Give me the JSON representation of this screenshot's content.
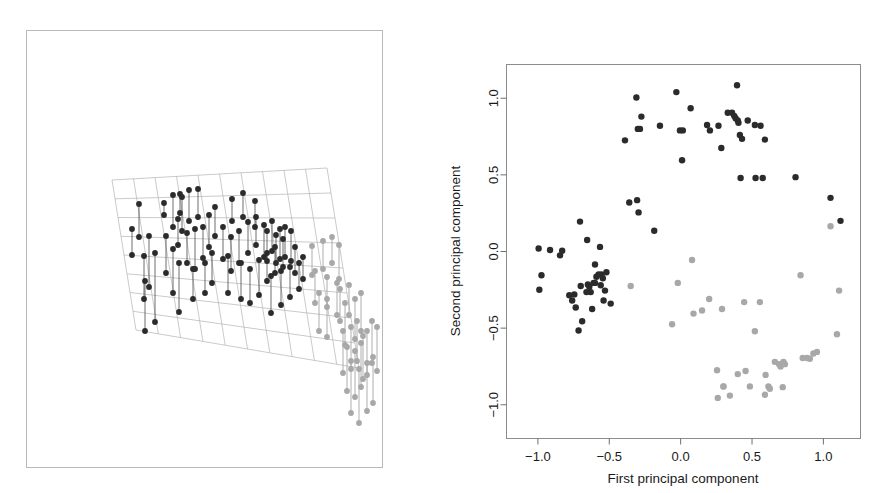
{
  "figure": {
    "panels": [
      "three-d-regression-plane",
      "pca-scatter"
    ],
    "background_color": "#ffffff"
  },
  "left_panel": {
    "name": "3D scatter with fitted plane",
    "border_color": "#b9b9b9",
    "mesh_color": "#b3b3b3",
    "dark_point_color": "#2b2b2b",
    "light_point_color": "#a8a8a8",
    "dark_line_color": "#4a4a4a",
    "light_line_color": "#9b9b9b"
  },
  "chart_data": [
    {
      "type": "scatter",
      "name": "three-d-plane-projection",
      "title": "",
      "xlabel": "",
      "ylabel": "",
      "grid": true,
      "legend": "none",
      "note": "Perspective 3-D scatterplot: points joined by vertical drop-lines to a fitted tilted regression plane drawn as a wire mesh.",
      "plane_mesh": {
        "corners": [
          [
            85,
            149
          ],
          [
            300,
            137
          ],
          [
            332,
            337
          ],
          [
            109,
            299
          ]
        ],
        "rows": 8,
        "cols": 10
      },
      "series": [
        {
          "name": "group-dark",
          "color": "#2b2b2b",
          "points": [
            [
              112,
              173,
              206
            ],
            [
              137,
              172,
              184
            ],
            [
              146,
              164,
              196
            ],
            [
              153,
              163,
              182
            ],
            [
              155,
              166,
              200
            ],
            [
              162,
              159,
              190
            ],
            [
              151,
              188,
              214
            ],
            [
              171,
              158,
              186
            ],
            [
              105,
              198,
              224
            ],
            [
              122,
              205,
              256
            ],
            [
              139,
              205,
              242
            ],
            [
              117,
              225,
              268
            ],
            [
              128,
              222,
              291
            ],
            [
              146,
              218,
              262
            ],
            [
              160,
              202,
              232
            ],
            [
              168,
              198,
              238
            ],
            [
              176,
              196,
              227
            ],
            [
              152,
              232,
              281
            ],
            [
              118,
              250,
              300
            ],
            [
              182,
              184,
              216
            ],
            [
              188,
              176,
              205
            ],
            [
              205,
              168,
              190
            ],
            [
              216,
              162,
              186
            ],
            [
              228,
              170,
              196
            ],
            [
              196,
              196,
              228
            ],
            [
              204,
              206,
              240
            ],
            [
              212,
              200,
              232
            ],
            [
              221,
              191,
              222
            ],
            [
              229,
              186,
              214
            ],
            [
              237,
              194,
              226
            ],
            [
              245,
              190,
              220
            ],
            [
              253,
              198,
              228
            ],
            [
              201,
              225,
              262
            ],
            [
              214,
              232,
              268
            ],
            [
              223,
              238,
              272
            ],
            [
              232,
              229,
              264
            ],
            [
              240,
              222,
              250
            ],
            [
              248,
              216,
              242
            ],
            [
              185,
              222,
              252
            ],
            [
              178,
              232,
              262
            ],
            [
              166,
              238,
              268
            ],
            [
              240,
              200,
              230
            ],
            [
              249,
              204,
              232
            ],
            [
              256,
              208,
              236
            ],
            [
              258,
              196,
              226
            ],
            [
              264,
              200,
              230
            ],
            [
              244,
              245,
              282
            ],
            [
              254,
              240,
              274
            ],
            [
              263,
              236,
              266
            ],
            [
              272,
              232,
              258
            ],
            [
              276,
              226,
              248
            ],
            [
              268,
              216,
              242
            ]
          ]
        },
        {
          "name": "group-light",
          "color": "#a8a8a8",
          "points": [
            [
              285,
              215,
              244
            ],
            [
              296,
              210,
              238
            ],
            [
              305,
              206,
              232
            ],
            [
              312,
              214,
              248
            ],
            [
              288,
              240,
              272
            ],
            [
              300,
              246,
              276
            ],
            [
              310,
              252,
              284
            ],
            [
              292,
              262,
              300
            ],
            [
              300,
              268,
              306
            ],
            [
              313,
              258,
              290
            ],
            [
              322,
              254,
              284
            ],
            [
              318,
              272,
              314
            ],
            [
              328,
              268,
              308
            ],
            [
              334,
              262,
              300
            ],
            [
              316,
              300,
              342
            ],
            [
              324,
              296,
              338
            ],
            [
              330,
              290,
              330
            ],
            [
              336,
              305,
              348
            ],
            [
              320,
              316,
              360
            ],
            [
              328,
              320,
              366
            ],
            [
              334,
              312,
              356
            ],
            [
              340,
              300,
              344
            ],
            [
              345,
              290,
              332
            ],
            [
              350,
              296,
              340
            ],
            [
              324,
              330,
              382
            ],
            [
              332,
              338,
              392
            ],
            [
              340,
              332,
              380
            ],
            [
              346,
              326,
              372
            ]
          ]
        }
      ]
    },
    {
      "type": "scatter",
      "name": "pca-scatter",
      "title": "",
      "xlabel": "First principal component",
      "ylabel": "Second principal component",
      "xlim": [
        -1.22,
        1.26
      ],
      "ylim": [
        -1.22,
        1.22
      ],
      "xticks": [
        -1.0,
        -0.5,
        0.0,
        0.5,
        1.0
      ],
      "xticklabels": [
        "-1.0",
        "-0.5",
        "0.0",
        "0.5",
        "1.0"
      ],
      "yticks": [
        1.0,
        0.5,
        0.0,
        -0.5,
        -1.0
      ],
      "yticklabels": [
        "1.0",
        "0.5",
        "0.0",
        "-0.5",
        "-1.0"
      ],
      "grid": false,
      "legend": "none",
      "series": [
        {
          "name": "group-dark",
          "color": "#2b2b2b",
          "x": [
            -0.995,
            -0.915,
            -0.845,
            -0.83,
            -0.975,
            -0.99,
            -0.705,
            -0.655,
            -0.65,
            -0.7,
            -0.78,
            -0.76,
            -0.745,
            -0.735,
            -0.64,
            -0.63,
            -0.62,
            -0.61,
            -0.6,
            -0.59,
            -0.565,
            -0.555,
            -0.545,
            -0.54,
            -0.53,
            -0.52,
            -0.49,
            -0.69,
            -0.66,
            -0.715,
            -0.56,
            -0.575,
            -0.6,
            -0.39,
            -0.36,
            -0.305,
            -0.295,
            -0.185,
            -0.31,
            -0.275,
            -0.3,
            -0.285,
            -0.145,
            -0.03,
            -0.005,
            0.01,
            0.07,
            0.015,
            0.185,
            0.205,
            0.265,
            0.285,
            0.33,
            0.36,
            0.375,
            0.385,
            0.395,
            0.4,
            0.405,
            0.415,
            0.43,
            0.42,
            0.47,
            0.52,
            0.56,
            0.575,
            0.59,
            0.525,
            0.805,
            1.05,
            1.12
          ],
          "y": [
            0.02,
            0.01,
            -0.025,
            0.005,
            -0.155,
            -0.25,
            0.195,
            0.075,
            -0.215,
            -0.225,
            -0.285,
            -0.32,
            -0.28,
            -0.365,
            -0.23,
            -0.265,
            -0.375,
            -0.205,
            -0.085,
            -0.165,
            0.03,
            -0.15,
            -0.175,
            -0.32,
            -0.255,
            -0.135,
            -0.34,
            -0.455,
            -0.265,
            -0.515,
            -0.22,
            -0.15,
            -0.205,
            0.725,
            0.32,
            0.335,
            0.255,
            0.135,
            1.005,
            0.88,
            0.8,
            0.8,
            0.82,
            1.04,
            0.79,
            0.595,
            0.935,
            0.79,
            0.825,
            0.79,
            0.82,
            0.675,
            0.905,
            0.905,
            0.885,
            0.87,
            1.085,
            0.855,
            0.84,
            0.76,
            0.735,
            0.48,
            0.855,
            0.825,
            0.82,
            0.48,
            0.73,
            0.48,
            0.485,
            0.35,
            0.2
          ],
          "count": 71
        },
        {
          "name": "group-light",
          "color": "#a8a8a8",
          "x": [
            -0.35,
            -0.06,
            -0.02,
            0.08,
            0.09,
            0.15,
            0.2,
            0.255,
            0.26,
            0.29,
            0.3,
            0.345,
            0.4,
            0.445,
            0.485,
            0.52,
            0.555,
            0.595,
            0.615,
            0.625,
            0.66,
            0.69,
            0.7,
            0.715,
            0.72,
            0.73,
            0.84,
            0.855,
            0.885,
            0.905,
            0.93,
            0.955,
            1.05,
            1.095,
            1.11,
            0.3,
            0.455,
            0.59
          ],
          "y": [
            -0.225,
            -0.475,
            -0.205,
            -0.055,
            -0.405,
            -0.385,
            -0.31,
            -0.775,
            -0.955,
            -0.375,
            -0.88,
            -0.94,
            -0.8,
            -0.33,
            -0.88,
            -0.52,
            -0.33,
            -0.805,
            -0.88,
            -0.895,
            -0.72,
            -0.735,
            -0.75,
            -0.885,
            -0.72,
            -0.735,
            -0.155,
            -0.695,
            -0.695,
            -0.7,
            -0.665,
            -0.655,
            0.165,
            -0.54,
            -0.255,
            -0.88,
            -0.78,
            -0.935
          ],
          "count": 38
        }
      ]
    }
  ],
  "right_panel": {
    "xlabel": "First principal component",
    "ylabel": "Second principal component",
    "xticklabels": [
      "-1.0",
      "-0.5",
      "0.0",
      "0.5",
      "1.0"
    ],
    "yticklabels": [
      "1.0",
      "0.5",
      "0.0",
      "-0.5",
      "-1.0"
    ],
    "frame_color": "#8c8c8c",
    "dark_point_color": "#2b2b2b",
    "light_point_color": "#a8a8a8"
  }
}
